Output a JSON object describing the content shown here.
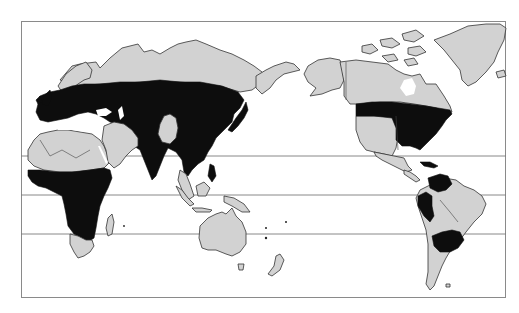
{
  "map": {
    "projection": "Pacific-centered world map",
    "style": "monochrome",
    "colors": {
      "background": "#ffffff",
      "land": "#d2d2d2",
      "distribution": "#0d0d0d",
      "frame": "#8a8a8a",
      "latitude_lines": "#7a7a7a"
    },
    "latitude_lines_count": 3,
    "legend_classes": [
      {
        "name": "land",
        "color": "#d2d2d2"
      },
      {
        "name": "distribution-area",
        "color": "#0d0d0d"
      }
    ],
    "shaded_regions": [
      "Europe",
      "Central/Northern Asia band",
      "China",
      "India",
      "Southeast Asia",
      "Japan",
      "Sub-Saharan Africa",
      "Eastern United States",
      "Colombia/Venezuela",
      "Peru/Ecuador",
      "Southern Brazil/Paraguay/Uruguay"
    ]
  }
}
